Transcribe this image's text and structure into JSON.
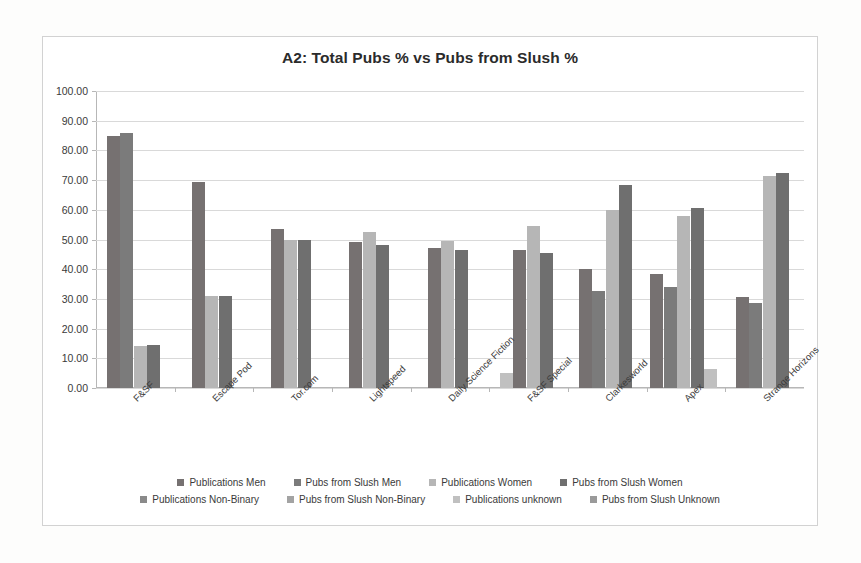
{
  "chart_data": {
    "type": "bar",
    "title": "A2: Total Pubs % vs Pubs from Slush %",
    "xlabel": "",
    "ylabel": "",
    "ylim": [
      0,
      100
    ],
    "ytick_labels": [
      "0.00",
      "10.00",
      "20.00",
      "30.00",
      "40.00",
      "50.00",
      "60.00",
      "70.00",
      "80.00",
      "90.00",
      "100.00"
    ],
    "ytick_values": [
      0,
      10,
      20,
      30,
      40,
      50,
      60,
      70,
      80,
      90,
      100
    ],
    "grid": true,
    "legend_position": "bottom",
    "categories": [
      "F&SF",
      "Escape Pod",
      "Tor.com",
      "Lightspeed",
      "Daily Science Fiction",
      "F&SF Special",
      "Clarkesworld",
      "Apex",
      "Strange Horizons"
    ],
    "series": [
      {
        "name": "Publications Men",
        "color": "#767171",
        "values": [
          85.0,
          69.5,
          53.5,
          49.0,
          47.0,
          null,
          40.0,
          38.5,
          30.5
        ]
      },
      {
        "name": "Pubs from Slush Men",
        "color": "#7b7b7b",
        "values": [
          86.0,
          null,
          null,
          null,
          null,
          null,
          32.5,
          34.0,
          28.5
        ]
      },
      {
        "name": "Publications Women",
        "color": "#b6b6b6",
        "values": [
          14.0,
          31.0,
          50.0,
          52.5,
          49.5,
          null,
          60.0,
          58.0,
          71.5
        ]
      },
      {
        "name": "Pubs from Slush Women",
        "color": "#6f6f6f",
        "values": [
          14.5,
          31.0,
          50.0,
          48.0,
          46.5,
          null,
          68.5,
          60.5,
          72.5
        ]
      },
      {
        "name": "Publications Non-Binary",
        "color": "#8a8a8a",
        "values": [
          null,
          null,
          null,
          null,
          null,
          null,
          null,
          null,
          null
        ]
      },
      {
        "name": "Pubs from Slush Non-Binary",
        "color": "#a3a3a3",
        "values": [
          null,
          null,
          null,
          null,
          null,
          null,
          null,
          null,
          null
        ]
      },
      {
        "name": "Publications unknown",
        "color": "#c0c0c0",
        "values": [
          null,
          null,
          null,
          null,
          null,
          5.0,
          null,
          6.5,
          null
        ]
      },
      {
        "name": "Pubs from Slush Unknown",
        "color": "#9a9a9a",
        "values": [
          null,
          null,
          null,
          null,
          null,
          null,
          null,
          null,
          null
        ]
      }
    ],
    "group_bars": [
      {
        "category": "F&SF",
        "bars": [
          {
            "series": "Publications Men",
            "value": 85.0,
            "color": "#767171"
          },
          {
            "series": "Pubs from Slush Men",
            "value": 86.0,
            "color": "#7b7b7b"
          },
          {
            "series": "Publications Women",
            "value": 14.0,
            "color": "#b6b6b6"
          },
          {
            "series": "Pubs from Slush Women",
            "value": 14.5,
            "color": "#6f6f6f"
          }
        ]
      },
      {
        "category": "Escape Pod",
        "bars": [
          {
            "series": "Publications Men",
            "value": 69.5,
            "color": "#767171"
          },
          {
            "series": "Publications Women",
            "value": 31.0,
            "color": "#b6b6b6"
          },
          {
            "series": "Pubs from Slush Women",
            "value": 31.0,
            "color": "#6f6f6f"
          }
        ]
      },
      {
        "category": "Tor.com",
        "bars": [
          {
            "series": "Publications Men",
            "value": 53.5,
            "color": "#767171"
          },
          {
            "series": "Publications Women",
            "value": 50.0,
            "color": "#b6b6b6"
          },
          {
            "series": "Pubs from Slush Women",
            "value": 50.0,
            "color": "#6f6f6f"
          }
        ]
      },
      {
        "category": "Lightspeed",
        "bars": [
          {
            "series": "Publications Men",
            "value": 49.0,
            "color": "#767171"
          },
          {
            "series": "Publications Women",
            "value": 52.5,
            "color": "#b6b6b6"
          },
          {
            "series": "Pubs from Slush Women",
            "value": 48.0,
            "color": "#6f6f6f"
          }
        ]
      },
      {
        "category": "Daily Science Fiction",
        "bars": [
          {
            "series": "Publications Men",
            "value": 47.0,
            "color": "#767171"
          },
          {
            "series": "Publications Women",
            "value": 49.5,
            "color": "#b6b6b6"
          },
          {
            "series": "Pubs from Slush Women",
            "value": 46.5,
            "color": "#6f6f6f"
          }
        ]
      },
      {
        "category": "F&SF Special",
        "bars": [
          {
            "series": "Publications unknown",
            "value": 5.0,
            "color": "#c0c0c0"
          },
          {
            "series": "Publications Men",
            "value": 46.5,
            "color": "#767171"
          },
          {
            "series": "Publications Women",
            "value": 54.5,
            "color": "#b6b6b6"
          },
          {
            "series": "Pubs from Slush Women",
            "value": 45.5,
            "color": "#6f6f6f"
          }
        ]
      },
      {
        "category": "Clarkesworld",
        "bars": [
          {
            "series": "Publications Men",
            "value": 40.0,
            "color": "#767171"
          },
          {
            "series": "Pubs from Slush Men",
            "value": 32.5,
            "color": "#7b7b7b"
          },
          {
            "series": "Publications Women",
            "value": 60.0,
            "color": "#b6b6b6"
          },
          {
            "series": "Pubs from Slush Women",
            "value": 68.5,
            "color": "#6f6f6f"
          }
        ]
      },
      {
        "category": "Apex",
        "bars": [
          {
            "series": "Publications Men",
            "value": 38.5,
            "color": "#767171"
          },
          {
            "series": "Pubs from Slush Men",
            "value": 34.0,
            "color": "#7b7b7b"
          },
          {
            "series": "Publications Women",
            "value": 58.0,
            "color": "#b6b6b6"
          },
          {
            "series": "Pubs from Slush Women",
            "value": 60.5,
            "color": "#6f6f6f"
          },
          {
            "series": "Publications unknown",
            "value": 6.5,
            "color": "#c0c0c0"
          }
        ]
      },
      {
        "category": "Strange Horizons",
        "bars": [
          {
            "series": "Publications Men",
            "value": 30.5,
            "color": "#767171"
          },
          {
            "series": "Pubs from Slush Men",
            "value": 28.5,
            "color": "#7b7b7b"
          },
          {
            "series": "Publications Women",
            "value": 71.5,
            "color": "#b6b6b6"
          },
          {
            "series": "Pubs from Slush Women",
            "value": 72.5,
            "color": "#6f6f6f"
          }
        ]
      }
    ]
  }
}
